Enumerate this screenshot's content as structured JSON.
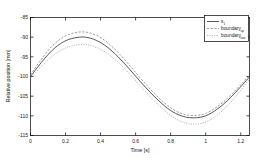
{
  "chart_data": {
    "type": "line",
    "title": "",
    "xlabel": "Time [s]",
    "ylabel": "Relative position [mm]",
    "xlim": [
      0,
      1.25
    ],
    "ylim": [
      -115,
      -85
    ],
    "grid": false,
    "legend_position": "upper right",
    "xticks": [
      "0",
      "0.2",
      "0.4",
      "0.6",
      "0.8",
      "1",
      "1.2"
    ],
    "xtick_values": [
      0,
      0.2,
      0.4,
      0.6,
      0.8,
      1,
      1.2
    ],
    "yticks": [
      "-85",
      "-90",
      "-95",
      "-100",
      "-105",
      "-110",
      "-115"
    ],
    "ytick_values": [
      -85,
      -90,
      -95,
      -100,
      -105,
      -110,
      -115
    ],
    "x": [
      0,
      0.0625,
      0.125,
      0.1875,
      0.25,
      0.3125,
      0.375,
      0.4375,
      0.5,
      0.5625,
      0.625,
      0.6875,
      0.75,
      0.8125,
      0.875,
      0.9375,
      1,
      1.0625,
      1.125,
      1.1875,
      1.25
    ],
    "series": [
      {
        "name": "s",
        "subscript": "1",
        "style": "solid",
        "color": "#3a3a3a",
        "values": [
          -100.0,
          -96.4,
          -93.3,
          -91.2,
          -90.2,
          -90.0,
          -90.8,
          -92.5,
          -95.0,
          -98.0,
          -101.2,
          -104.2,
          -106.9,
          -109.0,
          -110.2,
          -110.5,
          -110.0,
          -108.4,
          -106.1,
          -103.2,
          -100.1
        ]
      },
      {
        "name": "boundary",
        "subscript": "up",
        "style": "dashed",
        "color": "#7d7d7d",
        "values": [
          -99.6,
          -95.6,
          -92.2,
          -90.0,
          -88.9,
          -88.7,
          -89.5,
          -91.3,
          -93.9,
          -97.0,
          -100.3,
          -103.4,
          -106.2,
          -108.3,
          -109.6,
          -109.9,
          -109.4,
          -107.8,
          -105.5,
          -102.7,
          -99.7
        ]
      },
      {
        "name": "boundary",
        "subscript": "low",
        "style": "dotted",
        "color": "#9a9a9a",
        "values": [
          -100.4,
          -97.4,
          -94.8,
          -93.0,
          -92.1,
          -91.9,
          -92.6,
          -94.1,
          -96.4,
          -99.2,
          -102.3,
          -105.3,
          -108.1,
          -110.3,
          -111.7,
          -112.1,
          -111.6,
          -109.9,
          -107.4,
          -104.2,
          -100.6
        ]
      }
    ],
    "legend_entries": [
      {
        "label": "s",
        "sub": "1",
        "style": "solid"
      },
      {
        "label": "boundary",
        "sub": "up",
        "style": "dashed"
      },
      {
        "label": "boundary",
        "sub": "low",
        "style": "dotted"
      }
    ]
  }
}
